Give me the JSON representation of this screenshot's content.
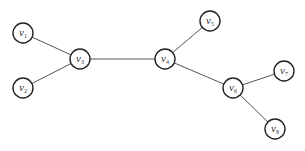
{
  "diagram": {
    "type": "tree-graph",
    "nodes": [
      {
        "id": "v1",
        "base": "v",
        "sub": "1",
        "x": 23,
        "y": 33
      },
      {
        "id": "v2",
        "base": "v",
        "sub": "2",
        "x": 23,
        "y": 88
      },
      {
        "id": "v3",
        "base": "v",
        "sub": "3",
        "x": 80,
        "y": 59
      },
      {
        "id": "v4",
        "base": "v",
        "sub": "4",
        "x": 165,
        "y": 59
      },
      {
        "id": "v5",
        "base": "v",
        "sub": "5",
        "x": 210,
        "y": 21
      },
      {
        "id": "v6",
        "base": "v",
        "sub": "6",
        "x": 233,
        "y": 88
      },
      {
        "id": "v7",
        "base": "v",
        "sub": "7",
        "x": 284,
        "y": 71
      },
      {
        "id": "v8",
        "base": "v",
        "sub": "8",
        "x": 275,
        "y": 129
      }
    ],
    "edges": [
      {
        "from": "v1",
        "to": "v3"
      },
      {
        "from": "v2",
        "to": "v3"
      },
      {
        "from": "v3",
        "to": "v4"
      },
      {
        "from": "v4",
        "to": "v5"
      },
      {
        "from": "v4",
        "to": "v6"
      },
      {
        "from": "v6",
        "to": "v7"
      },
      {
        "from": "v6",
        "to": "v8"
      }
    ],
    "node_radius": 10,
    "colors": {
      "edge": "#555555",
      "node_stroke": "#222222",
      "node_fill": "#ffffff",
      "label": "#333333"
    }
  }
}
